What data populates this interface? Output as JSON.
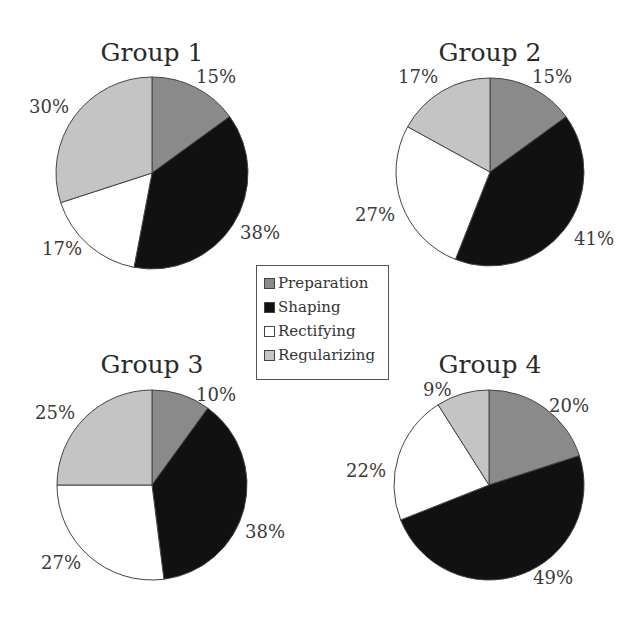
{
  "chart_data": [
    {
      "type": "pie",
      "title": "Group 1",
      "categories": [
        "Preparation",
        "Shaping",
        "Rectifying",
        "Regularizing"
      ],
      "values": [
        15,
        38,
        17,
        30
      ],
      "labels": [
        "15%",
        "38%",
        "17%",
        "30%"
      ]
    },
    {
      "type": "pie",
      "title": "Group 2",
      "categories": [
        "Preparation",
        "Shaping",
        "Rectifying",
        "Regularizing"
      ],
      "values": [
        15,
        41,
        27,
        17
      ],
      "labels": [
        "15%",
        "41%",
        "27%",
        "17%"
      ]
    },
    {
      "type": "pie",
      "title": "Group 3",
      "categories": [
        "Preparation",
        "Shaping",
        "Rectifying",
        "Regularizing"
      ],
      "values": [
        10,
        38,
        27,
        25
      ],
      "labels": [
        "10%",
        "38%",
        "27%",
        "25%"
      ]
    },
    {
      "type": "pie",
      "title": "Group 4",
      "categories": [
        "Preparation",
        "Shaping",
        "Rectifying",
        "Regularizing"
      ],
      "values": [
        20,
        49,
        22,
        9
      ],
      "labels": [
        "20%",
        "49%",
        "22%",
        "9%"
      ]
    }
  ],
  "legend": {
    "position": "center",
    "items": [
      {
        "label": "Preparation",
        "color": "#8a8a8a"
      },
      {
        "label": "Shaping",
        "color": "#111111"
      },
      {
        "label": "Rectifying",
        "color": "#ffffff"
      },
      {
        "label": "Regularizing",
        "color": "#c4c4c4"
      }
    ]
  }
}
